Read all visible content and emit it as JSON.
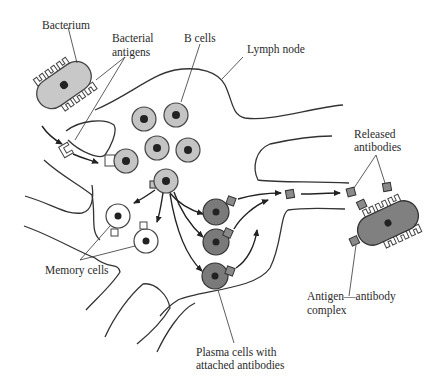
{
  "diagram": {
    "labels": {
      "bacterium": "Bacterium",
      "bacterial_antigens_1": "Bacterial",
      "bacterial_antigens_2": "antigens",
      "b_cells": "B cells",
      "lymph_node": "Lymph node",
      "released_antibodies_1": "Released",
      "released_antibodies_2": "antibodies",
      "memory_cells": "Memory cells",
      "complex_1": "Antigen—antibody",
      "complex_2": "complex",
      "plasma_1": "Plasma cells with",
      "plasma_2": "attached antibodies"
    },
    "colors": {
      "b_cell_fill": "#c4c4c4",
      "plasma_cell_fill": "#7a7a7a",
      "memory_cell_fill": "#ffffff",
      "bacterium_fill": "#c8c8c8",
      "complex_fill": "#808080",
      "antibody_fill": "#8a8a8a",
      "stroke": "#333333"
    },
    "nodes": [
      {
        "id": "bacterium",
        "type": "bacterium"
      },
      {
        "id": "b-cells",
        "type": "cell-group",
        "count": 6
      },
      {
        "id": "activated-b-cell",
        "type": "cell"
      },
      {
        "id": "memory-cells",
        "type": "cell-group",
        "count": 2
      },
      {
        "id": "plasma-cells",
        "type": "cell-group",
        "count": 3
      },
      {
        "id": "released-antibodies",
        "type": "molecule-group",
        "count": 3
      },
      {
        "id": "antigen-antibody-complex",
        "type": "complex"
      }
    ],
    "edges": [
      {
        "from": "bacterium",
        "to": "bacterial-antigen"
      },
      {
        "from": "bacterial-antigen",
        "to": "b-cell-with-antigen"
      },
      {
        "from": "activated-b-cell",
        "to": "memory-cells"
      },
      {
        "from": "activated-b-cell",
        "to": "plasma-cells"
      },
      {
        "from": "plasma-cells",
        "to": "released-antibodies"
      },
      {
        "from": "released-antibodies",
        "to": "antigen-antibody-complex"
      }
    ]
  }
}
